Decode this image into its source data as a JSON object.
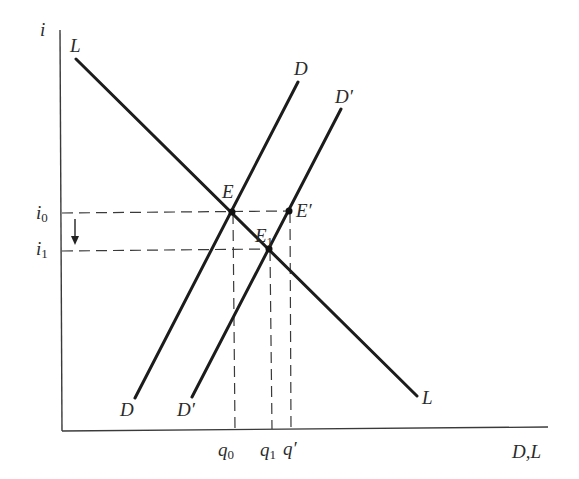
{
  "diagram": {
    "type": "supply-demand",
    "axes": {
      "y_label": "i",
      "x_label": "D,L"
    },
    "curves": [
      {
        "id": "L",
        "label_start": "L",
        "label_end": "L",
        "style": "solid"
      },
      {
        "id": "D",
        "label_start": "D",
        "label_end": "D",
        "style": "solid"
      },
      {
        "id": "D_prime",
        "label_start": "D′",
        "label_end": "D′",
        "style": "solid"
      }
    ],
    "points": [
      {
        "id": "E",
        "label": "E",
        "on": [
          "L",
          "D"
        ]
      },
      {
        "id": "E_prime",
        "label": "E′",
        "on": [
          "D_prime"
        ]
      },
      {
        "id": "E1",
        "label_main": "E",
        "label_sub": "1",
        "on": [
          "L",
          "D_prime"
        ]
      }
    ],
    "y_ticks": [
      {
        "id": "i0",
        "main": "i",
        "sub": "0"
      },
      {
        "id": "i1",
        "main": "i",
        "sub": "1"
      }
    ],
    "x_ticks": [
      {
        "id": "q0",
        "main": "q",
        "sub": "0"
      },
      {
        "id": "q1",
        "main": "q",
        "sub": "1"
      },
      {
        "id": "q_prime",
        "main": "q′",
        "sub": ""
      }
    ],
    "arrow": {
      "from": "i0",
      "to": "i1",
      "direction": "down"
    }
  }
}
